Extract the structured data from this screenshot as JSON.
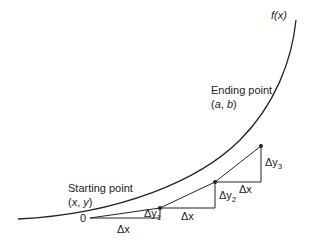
{
  "diagram": {
    "curve_label": "f(x)",
    "start": {
      "title": "Starting point",
      "coords_open": "(",
      "coords_x": "x",
      "coords_sep": ", ",
      "coords_y": "y",
      "coords_close": ")",
      "origin_label": "0"
    },
    "end": {
      "title": "Ending point",
      "coords_open": "(",
      "coords_x": "a",
      "coords_sep": ", ",
      "coords_y": "b",
      "coords_close": ")"
    },
    "steps": [
      {
        "dx_label": "Δx",
        "dy_prefix": "Δy",
        "dy_sub": "1"
      },
      {
        "dx_label": "Δx",
        "dy_prefix": "Δy",
        "dy_sub": "2"
      },
      {
        "dx_label": "Δx",
        "dy_prefix": "Δy",
        "dy_sub": "3"
      }
    ],
    "colors": {
      "line": "#222222",
      "background": "#ffffff"
    }
  }
}
